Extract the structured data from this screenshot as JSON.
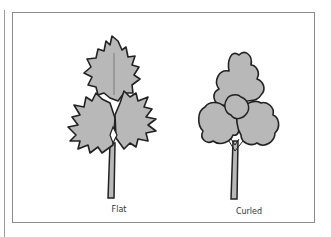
{
  "figure": {
    "labels": {
      "flat": "Flat",
      "curled": "Curled"
    },
    "colors": {
      "leaf_fill": "#b8b8b8",
      "outline": "#222222",
      "frame": "#8a8a8a",
      "background": "#ffffff"
    }
  }
}
